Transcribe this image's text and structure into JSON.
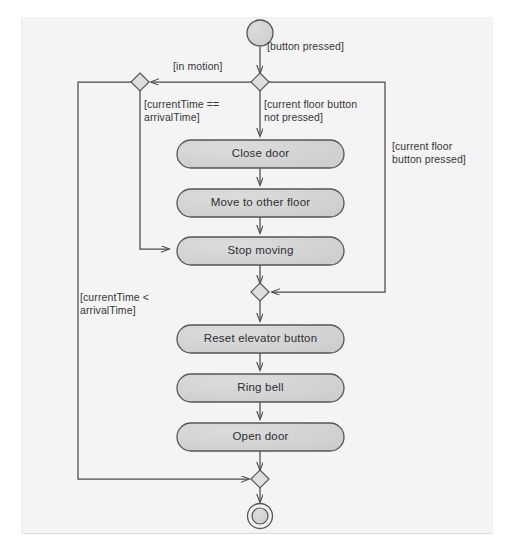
{
  "diagram": {
    "type": "uml-activity-diagram",
    "background_color": "#f4f4f4",
    "node_fill_color": "#d4d4d4",
    "node_stroke_color": "#555555",
    "line_color": "#4a4a4a",
    "text_color": "#2e2e33",
    "initial_node": {
      "name": "initial-node",
      "shape": "filled-circle",
      "cx": 260,
      "cy": 33,
      "r": 13
    },
    "final_node": {
      "name": "final-node",
      "shape": "double-circle",
      "cx": 260,
      "cy": 516,
      "r_outer": 12,
      "r_inner": 8
    },
    "decisions": [
      {
        "id": "d-top",
        "name": "decision-top",
        "cx": 260,
        "cy": 82
      },
      {
        "id": "d-left",
        "name": "decision-left-merge",
        "cx": 140,
        "cy": 82
      },
      {
        "id": "d-mid",
        "name": "decision-middle-merge",
        "cx": 260,
        "cy": 292
      },
      {
        "id": "d-bottom",
        "name": "decision-bottom-merge",
        "cx": 260,
        "cy": 479
      }
    ],
    "actions": [
      {
        "id": "a1",
        "label": "Close door",
        "x": 177,
        "y": 140,
        "w": 167,
        "h": 28
      },
      {
        "id": "a2",
        "label": "Move to other floor",
        "x": 177,
        "y": 189,
        "w": 167,
        "h": 28
      },
      {
        "id": "a3",
        "label": "Stop moving",
        "x": 177,
        "y": 237,
        "w": 167,
        "h": 28
      },
      {
        "id": "a4",
        "label": "Reset elevator button",
        "x": 177,
        "y": 325,
        "w": 167,
        "h": 28
      },
      {
        "id": "a5",
        "label": "Ring bell",
        "x": 177,
        "y": 374,
        "w": 167,
        "h": 28
      },
      {
        "id": "a6",
        "label": "Open door",
        "x": 177,
        "y": 423,
        "w": 167,
        "h": 28
      }
    ],
    "guards": [
      {
        "id": "g-button-pressed",
        "name": "guard-button-pressed",
        "text": "[button pressed]",
        "x": 267,
        "y": 40,
        "lines": [
          "[button pressed]"
        ]
      },
      {
        "id": "g-in-motion",
        "name": "guard-in-motion",
        "text": "[in motion]",
        "x": 173,
        "y": 60,
        "lines": [
          "[in motion]"
        ]
      },
      {
        "id": "g-currenttime-eq",
        "name": "guard-current-time-equals-arrival-time",
        "text": "[currentTime ==\narrivalTime]",
        "x": 144,
        "y": 98,
        "lines": [
          "[currentTime ==",
          "arrivalTime]"
        ]
      },
      {
        "id": "g-floor-not-pressed",
        "name": "guard-current-floor-button-not-pressed",
        "text": "[current floor button\nnot pressed]",
        "x": 264,
        "y": 98,
        "lines": [
          "[current floor button",
          "not pressed]"
        ]
      },
      {
        "id": "g-floor-pressed",
        "name": "guard-current-floor-button-pressed",
        "text": "[current floor\nbutton pressed]",
        "x": 392,
        "y": 140,
        "lines": [
          "[current floor",
          "button pressed]"
        ]
      },
      {
        "id": "g-currenttime-lt",
        "name": "guard-current-time-less-than-arrival-time",
        "text": "[currentTime <\narrivalTime]",
        "x": 80,
        "y": 291,
        "lines": [
          "[currentTime <",
          "arrivalTime]"
        ]
      }
    ],
    "flows": [
      {
        "from": "initial-node",
        "to": "decision-top",
        "guard": "[button pressed]"
      },
      {
        "from": "decision-top",
        "to": "decision-left-merge",
        "guard": "[in motion]"
      },
      {
        "from": "decision-top",
        "to": "Close door",
        "guard": "[current floor button not pressed]"
      },
      {
        "from": "decision-top",
        "to": "decision-middle-merge",
        "guard": "[current floor button pressed]"
      },
      {
        "from": "decision-left-merge",
        "to": "Stop moving",
        "guard": "[currentTime == arrivalTime]"
      },
      {
        "from": "decision-left-merge",
        "to": "decision-bottom-merge",
        "guard": "[currentTime < arrivalTime]"
      },
      {
        "from": "Close door",
        "to": "Move to other floor",
        "guard": ""
      },
      {
        "from": "Move to other floor",
        "to": "Stop moving",
        "guard": ""
      },
      {
        "from": "Stop moving",
        "to": "decision-middle-merge",
        "guard": ""
      },
      {
        "from": "decision-middle-merge",
        "to": "Reset elevator button",
        "guard": ""
      },
      {
        "from": "Reset elevator button",
        "to": "Ring bell",
        "guard": ""
      },
      {
        "from": "Ring bell",
        "to": "Open door",
        "guard": ""
      },
      {
        "from": "Open door",
        "to": "decision-bottom-merge",
        "guard": ""
      },
      {
        "from": "decision-bottom-merge",
        "to": "final-node",
        "guard": ""
      }
    ]
  }
}
